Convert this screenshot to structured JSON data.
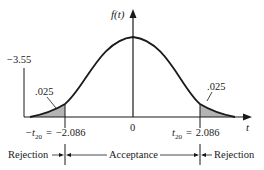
{
  "figure": {
    "y_axis_label": "f(t)",
    "x_axis_label": "t",
    "left_marker_value": "−3.55",
    "tail_area_left": ".025",
    "tail_area_right": ".025",
    "origin_label": "0",
    "left_critical": {
      "symbol": "−t",
      "subscript": "20",
      "equals": "=",
      "value": "−2.086"
    },
    "right_critical": {
      "symbol": "t",
      "subscript": "20",
      "equals": "=",
      "value": "2.086"
    },
    "regions": {
      "left": "Rejection",
      "middle": "Acceptance",
      "right": "Rejection"
    }
  },
  "colors": {
    "ink": "#1a1a1a",
    "shade": "#b4b4b4"
  }
}
